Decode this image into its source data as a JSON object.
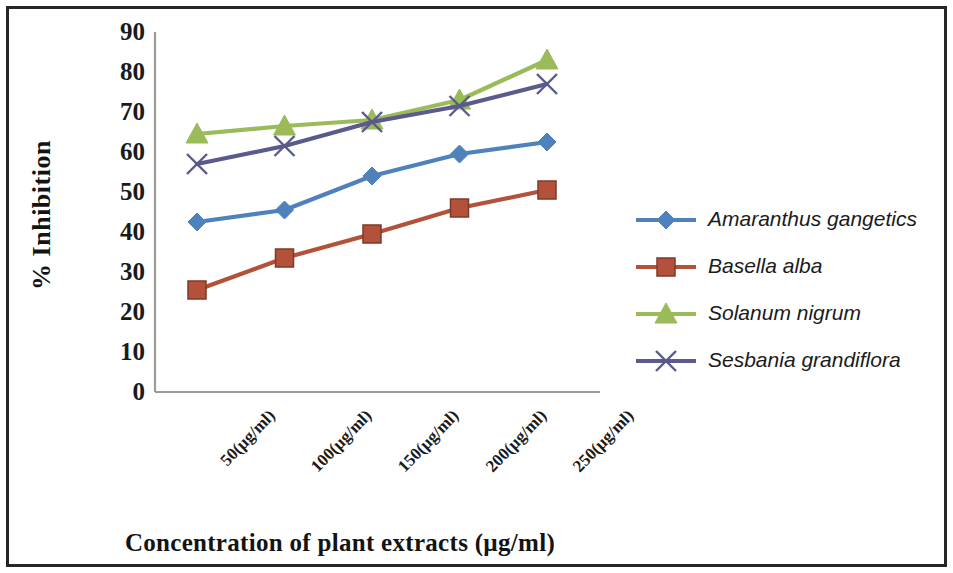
{
  "chart_data": {
    "type": "line",
    "title": "",
    "xlabel": "Concentration of plant extracts (µg/ml)",
    "ylabel": "% Inhibition",
    "categories": [
      "50(µg/ml)",
      "100(µg/ml)",
      "150(µg/ml)",
      "200(µg/ml)",
      "250(µg/ml)"
    ],
    "ylim": [
      0,
      90
    ],
    "ytick_step": 10,
    "yticks": [
      "0",
      "10",
      "20",
      "30",
      "40",
      "50",
      "60",
      "70",
      "80",
      "90"
    ],
    "grid": false,
    "legend_position": "right",
    "series": [
      {
        "name": "Amaranthus  gangetics",
        "color": "#4f81bd",
        "marker": "diamond",
        "values": [
          42.5,
          45.5,
          54,
          59.5,
          62.5
        ]
      },
      {
        "name": "Basella alba",
        "color": "#b4513a",
        "marker": "square",
        "values": [
          25.5,
          33.5,
          39.5,
          46,
          50.5
        ]
      },
      {
        "name": "Solanum nigrum",
        "color": "#9bbb59",
        "marker": "triangle",
        "values": [
          64.5,
          66.5,
          68,
          73,
          83
        ]
      },
      {
        "name": "Sesbania grandiflora",
        "color": "#5a5a8c",
        "marker": "x",
        "values": [
          57,
          61.5,
          67.5,
          71.5,
          77
        ]
      }
    ]
  },
  "legend": {
    "items": [
      {
        "label": "Amaranthus  gangetics"
      },
      {
        "label": "Basella alba"
      },
      {
        "label": "Solanum nigrum"
      },
      {
        "label": "Sesbania grandiflora"
      }
    ]
  },
  "axes": {
    "y_title": "% Inhibition",
    "x_title": "Concentration of plant extracts (µg/ml)"
  },
  "colors": {
    "axis_line": "#9a9a9a",
    "border": "#262626",
    "text": "#1a1a1a"
  }
}
